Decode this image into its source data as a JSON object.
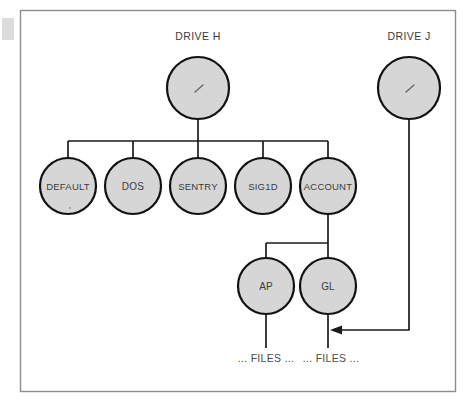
{
  "figure": {
    "kind": "directory-tree-diagram",
    "frame": {
      "stroke_color": "#8d8d8d"
    },
    "palette": {
      "node_fill": "#d6d6d6",
      "node_stroke": "#111111",
      "line": "#1a1a1a",
      "text": "#3a3a3a",
      "background": "#ffffff"
    }
  },
  "drives": {
    "h": {
      "label": "DRIVE H",
      "root_symbol": "\\"
    },
    "j": {
      "label": "DRIVE J",
      "root_symbol": "\\"
    }
  },
  "nodes": {
    "level1": [
      {
        "label": "DEFAULT"
      },
      {
        "label": "DOS"
      },
      {
        "label": "SENTRY"
      },
      {
        "label": "SIG1D"
      },
      {
        "label": "ACCOUNT"
      }
    ],
    "level2": [
      {
        "label": "AP"
      },
      {
        "label": "GL"
      }
    ]
  },
  "files": {
    "under_ap": "... FILES ...",
    "under_gl": "... FILES ..."
  },
  "tree_data": {
    "type": "tree",
    "roots": [
      {
        "name": "DRIVE H",
        "children": [
          {
            "name": "DEFAULT",
            "children": []
          },
          {
            "name": "DOS",
            "children": []
          },
          {
            "name": "SENTRY",
            "children": []
          },
          {
            "name": "SIG1D",
            "children": []
          },
          {
            "name": "ACCOUNT",
            "children": [
              {
                "name": "AP",
                "children": [
                  "... FILES ..."
                ]
              },
              {
                "name": "GL",
                "children": [
                  "... FILES ..."
                ]
              }
            ]
          }
        ]
      },
      {
        "name": "DRIVE J",
        "children": [],
        "mapped_to": "GL"
      }
    ],
    "annotations": [
      {
        "type": "arrow",
        "from": "DRIVE J",
        "to": "GL",
        "description": "DRIVE J maps to the GL directory"
      }
    ]
  }
}
